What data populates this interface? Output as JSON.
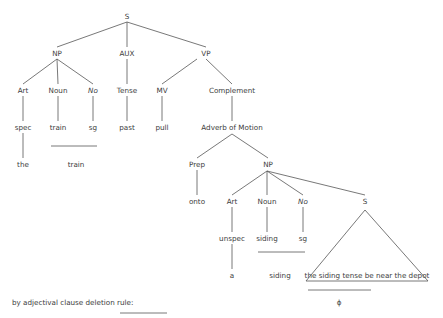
{
  "tree": {
    "root": "S",
    "level1": {
      "np": "NP",
      "aux": "AUX",
      "vp": "VP"
    },
    "np_children": {
      "art": "Art",
      "noun": "Noun",
      "no": "No"
    },
    "np_leaves": {
      "art": "spec",
      "noun": "train",
      "no": "sg"
    },
    "np_surface": {
      "art": "the",
      "noun": "train"
    },
    "aux_child": "Tense",
    "aux_leaf": "past",
    "vp_children": {
      "mv": "MV",
      "complement": "Complement"
    },
    "mv_leaf": "pull",
    "complement_child": "Adverb of Motion",
    "adverb_children": {
      "prep": "Prep",
      "np": "NP"
    },
    "prep_leaf": "onto",
    "np2_children": {
      "art": "Art",
      "noun": "Noun",
      "no": "No",
      "s": "S"
    },
    "np2_leaves": {
      "art": "unspec",
      "noun": "siding",
      "no": "sg"
    },
    "np2_surface": {
      "art": "a",
      "noun": "siding"
    },
    "embedded_clause": "the siding tense be near the depot",
    "deletion_result": "ϕ"
  },
  "caption": "by adjectival clause deletion rule:",
  "colors": {
    "line": "#555555",
    "text": "#3c3c3c",
    "background": "#ffffff"
  }
}
